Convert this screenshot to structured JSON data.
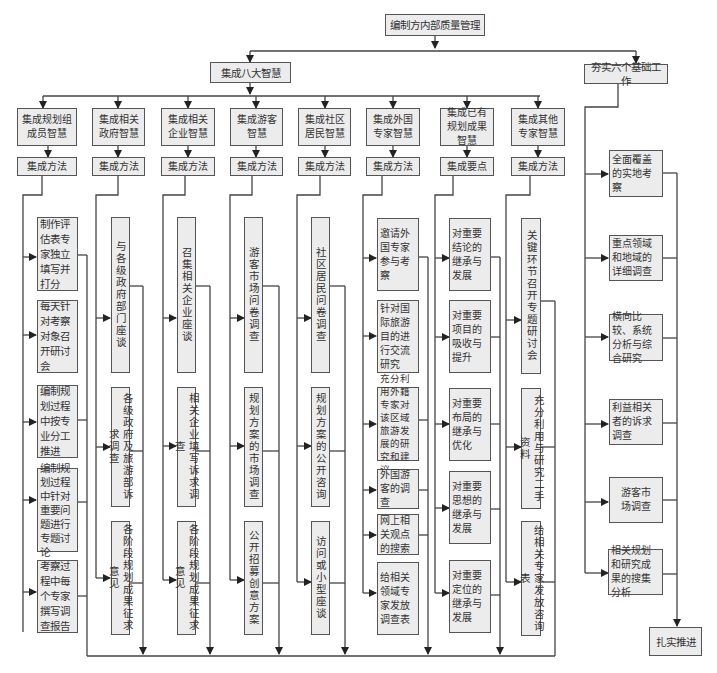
{
  "title": "编制方内部质量管理",
  "branches": {
    "left": "集成八大智慧",
    "right": "夯实六个基础工作"
  },
  "columns": [
    {
      "name": "集成规划组成员智慧",
      "method": "集成方法",
      "items": [
        "制作评估表专家独立填写并打分",
        "每天针对考察对象召开研讨会",
        "编制规划过程中按专业分工推进",
        "编制规划过程中针对重要问题进行专题讨论",
        "考察过程中每个专家撰写调查报告"
      ]
    },
    {
      "name": "集成相关政府智慧",
      "method": "集成方法",
      "items": [
        "与各级政府部门座谈",
        "各级政府及旅游部诉求调查",
        "各阶段规划成果征求意见"
      ]
    },
    {
      "name": "集成相关企业智慧",
      "method": "集成方法",
      "items": [
        "召集相关企业座谈",
        "相关企业填写诉求调查",
        "各阶段规划成果征求意见"
      ]
    },
    {
      "name": "集成游客智慧",
      "method": "集成方法",
      "items": [
        "游客市场问卷调查",
        "规划方案的市场调查",
        "公开招募创意方案"
      ]
    },
    {
      "name": "集成社区居民智慧",
      "method": "集成方法",
      "items": [
        "社区居民问卷调查",
        "规划方案的公开咨询",
        "访问或小型座谈"
      ]
    },
    {
      "name": "集成外国专家智慧",
      "method": "集成方法",
      "items": [
        "邀请外国专家参与考察",
        "针对国际旅游目的进行交流研究",
        "充分利用外籍专家对该区域旅游发展的研究和建议",
        "外国游客的调查",
        "网上相关观点的搜索",
        "给相关领域专家发放调查表"
      ]
    },
    {
      "name": "集成已有规划成果智慧",
      "method": "集成要点",
      "items": [
        "对重要结论的继承与发展",
        "对重要项目的吸收与提升",
        "对重要布局的继承与优化",
        "对重要思想的继承与发展",
        "对重要定位的继承与发展"
      ]
    },
    {
      "name": "集成其他专家智慧",
      "method": "集成方法",
      "items": [
        "关键环节召开专题研讨会",
        "充分利用与研究二手资料",
        "给相关专家发放咨询表"
      ]
    }
  ],
  "foundation_items": [
    "全面覆盖的实地考察",
    "重点领域和地域的详细调查",
    "横向比较、系统分析与综合研究",
    "利益相关者的诉求调查",
    "游客市场调查",
    "相关规划和研究成果的搜集分析"
  ],
  "result": "扎实推进",
  "colors": {
    "box_fill": "#ececec",
    "border": "#555555",
    "line": "#444444",
    "background": "#ffffff"
  }
}
